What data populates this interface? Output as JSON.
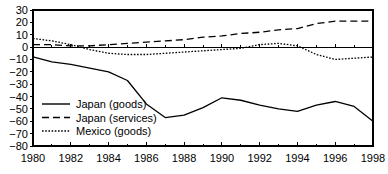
{
  "chart_data": {
    "type": "line",
    "title": "",
    "subtitle": "",
    "xlabel": "",
    "ylabel": "",
    "xlim": [
      1980,
      1998
    ],
    "ylim": [
      -80,
      30
    ],
    "grid": false,
    "legend_position": "inside-lower-left",
    "y_ticks": [
      30,
      20,
      10,
      0,
      -10,
      -20,
      -30,
      -40,
      -50,
      -60,
      -70,
      -80
    ],
    "y_tick_labels": [
      "30",
      "20",
      "10",
      "0",
      "−10",
      "−20",
      "−30",
      "−40",
      "−50",
      "−60",
      "−70",
      "−80"
    ],
    "x_ticks": [
      1980,
      1981,
      1982,
      1983,
      1984,
      1985,
      1986,
      1987,
      1988,
      1989,
      1990,
      1991,
      1992,
      1993,
      1994,
      1995,
      1996,
      1997,
      1998
    ],
    "x_tick_labels_major": [
      "1980",
      "1982",
      "1984",
      "1986",
      "1988",
      "1990",
      "1992",
      "1994",
      "1996",
      "1998"
    ],
    "x_major_years": [
      1980,
      1982,
      1984,
      1986,
      1988,
      1990,
      1992,
      1994,
      1996,
      1998
    ],
    "x": [
      1980,
      1981,
      1982,
      1983,
      1984,
      1985,
      1986,
      1987,
      1988,
      1989,
      1990,
      1991,
      1992,
      1993,
      1994,
      1995,
      1996,
      1997,
      1998
    ],
    "series": [
      {
        "name": "Japan (goods)",
        "style": "solid",
        "color": "#000000",
        "values": [
          -8,
          -12,
          -14,
          -17,
          -20,
          -27,
          -46,
          -57,
          -55,
          -49,
          -41,
          -43,
          -47,
          -50,
          -52,
          -47,
          -44,
          -48,
          -60
        ]
      },
      {
        "name": "Japan (services)",
        "style": "dashed",
        "color": "#000000",
        "values": [
          2,
          2,
          1,
          1,
          2,
          3,
          4,
          5,
          6,
          8,
          9,
          11,
          12,
          14,
          15,
          19,
          21,
          21,
          21
        ]
      },
      {
        "name": "Mexico (goods)",
        "style": "dotted",
        "color": "#000000",
        "values": [
          7,
          5,
          2,
          -2,
          -5,
          -6,
          -6,
          -5,
          -4,
          -3,
          -2,
          -1,
          2,
          3,
          1,
          -6,
          -10,
          -9,
          -8
        ]
      }
    ]
  },
  "legend": {
    "items": [
      {
        "label": "Japan (goods)",
        "style": "solid"
      },
      {
        "label": "Japan (services)",
        "style": "dashed"
      },
      {
        "label": "Mexico (goods)",
        "style": "dotted"
      }
    ]
  }
}
